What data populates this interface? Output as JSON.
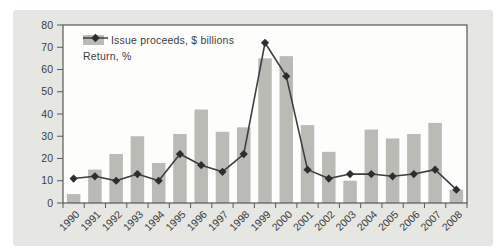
{
  "figure": {
    "panel_bg": "#e6e6e2",
    "plot_bg": "#fdfdfc",
    "frame_color": "#58595c",
    "bar_color": "#b9bbb4",
    "line_color": "#3e3f41",
    "marker_color": "#2d2e30",
    "text_color": "#3c3d3f"
  },
  "chart_data": {
    "type": "bar",
    "title": "",
    "xlabel": "",
    "ylabel": "",
    "categories": [
      "1990",
      "1991",
      "1992",
      "1993",
      "1994",
      "1995",
      "1996",
      "1997",
      "1998",
      "1999",
      "2000",
      "2001",
      "2002",
      "2003",
      "2004",
      "2005",
      "2006",
      "2007",
      "2008"
    ],
    "series": [
      {
        "name": "Issue proceeds, $ billions",
        "type": "bar",
        "values": [
          4,
          15,
          22,
          30,
          18,
          31,
          42,
          32,
          34,
          65,
          66,
          35,
          23,
          10,
          33,
          29,
          31,
          36,
          6
        ]
      },
      {
        "name": "Return, %",
        "type": "line",
        "values": [
          11,
          12,
          10,
          13,
          10,
          22,
          17,
          14,
          22,
          72,
          57,
          15,
          11,
          13,
          13,
          12,
          13,
          15,
          6
        ]
      }
    ],
    "ylim": [
      0,
      80
    ],
    "ytick_step": 10,
    "yticks": [
      0,
      10,
      20,
      30,
      40,
      50,
      60,
      70,
      80
    ],
    "grid": false,
    "legend_position": "upper-left-inside"
  }
}
